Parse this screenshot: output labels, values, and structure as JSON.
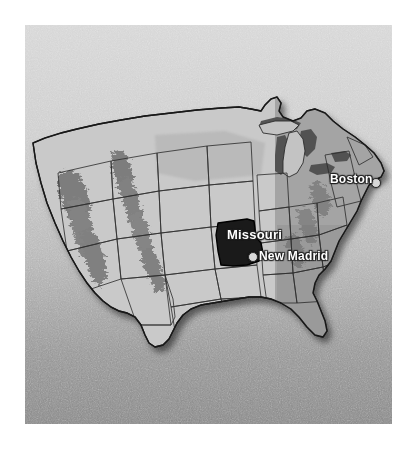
{
  "figure": {
    "kind": "relief-map",
    "region": "contiguous-united-states",
    "width": 416,
    "height": 455
  },
  "panel": {
    "background_color_top": "#d6d6d6",
    "background_color_bottom": "#888888",
    "texture": "noise-grain"
  },
  "map": {
    "land_fill": "#c9c9c9",
    "land_fill_east": "#a8a8a8",
    "border_color": "#1d1d1d",
    "state_border_color": "#2e2e2e",
    "lake_fill": "#4a4a4a",
    "highlight_fill": "#1c1c1c",
    "shadow_color": "rgba(0,0,0,0.45)",
    "highlighted_state": "Missouri"
  },
  "labels": [
    {
      "id": "missouri",
      "text": "Missouri",
      "type": "state-label",
      "has_dot": false,
      "x": 227,
      "y": 227,
      "font_size": 13
    },
    {
      "id": "new-madrid",
      "text": "New Madrid",
      "type": "city-label",
      "has_dot": true,
      "dot_x": 248,
      "dot_y": 252,
      "x": 259,
      "y": 249,
      "font_size": 12
    },
    {
      "id": "boston",
      "text": "Boston",
      "type": "city-label",
      "has_dot": true,
      "dot_x": 371,
      "dot_y": 178,
      "x": 330,
      "y": 172,
      "font_size": 12
    }
  ]
}
